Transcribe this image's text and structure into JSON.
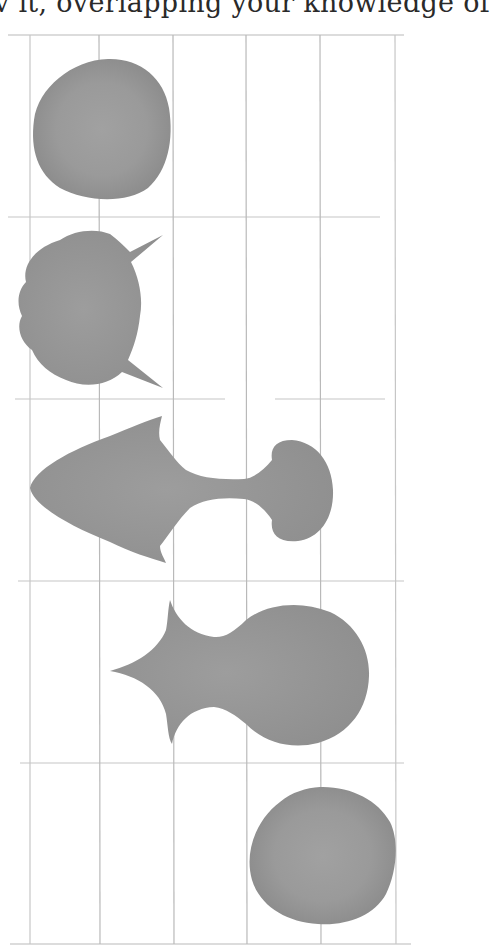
{
  "page": {
    "caption_fragment": "v it, overlapping your knowledge of"
  },
  "figure": {
    "grid": {
      "columns_x": [
        30,
        99,
        173,
        246,
        320,
        395
      ],
      "rows_y": [
        35,
        217,
        399,
        581,
        763,
        944
      ],
      "line_color": "#c2c2c2"
    },
    "fill_colors": {
      "center": "#9e9e9e",
      "edge": "#8c8c8c"
    },
    "shapes": [
      {
        "id": "row-1",
        "label": "round blob",
        "cx": 101,
        "cy": 128
      },
      {
        "id": "row-2",
        "label": "lobed blob with two spikes",
        "cx": 80,
        "cy": 308
      },
      {
        "id": "row-3",
        "label": "arrow body with neck and mushroom head",
        "cx": 180,
        "cy": 490
      },
      {
        "id": "row-4",
        "label": "three-point star merging into circle",
        "cx": 240,
        "cy": 673
      },
      {
        "id": "row-5",
        "label": "round blob",
        "cx": 323,
        "cy": 856
      }
    ]
  }
}
